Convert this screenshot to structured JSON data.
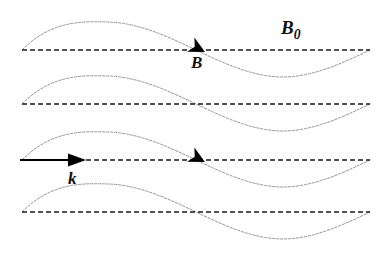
{
  "figure": {
    "type": "physics-wave-diagram",
    "canvas": {
      "width": 390,
      "height": 255,
      "background": "#ffffff"
    },
    "colors": {
      "axis_line": "#1a1a1a",
      "wave_curve": "#8a8a8a",
      "arrow": "#000000",
      "label_text": "#101010"
    },
    "axes": {
      "count": 4,
      "style": "dashed",
      "dash_length": 5,
      "dash_gap": 3,
      "thickness": 1.6,
      "x_start": 22,
      "x_end": 370,
      "y_positions": [
        50,
        104,
        160,
        212
      ]
    },
    "waves": {
      "count": 4,
      "style": "fine-dashed",
      "thickness": 0.9,
      "shape": "sine",
      "cycles": 1,
      "amplitude": 28,
      "x_start": 22,
      "x_end": 370,
      "crest_x": 109,
      "zero_crossing_x": 196,
      "trough_x": 283,
      "rows": [
        {
          "index": 1,
          "baseline_y": 50
        },
        {
          "index": 2,
          "baseline_y": 104
        },
        {
          "index": 3,
          "baseline_y": 160
        },
        {
          "index": 4,
          "baseline_y": 212
        }
      ]
    },
    "arrowheads": [
      {
        "name": "B-arrowhead-row1",
        "x": 200,
        "y": 50,
        "angle_deg": 27,
        "row": 1
      },
      {
        "name": "B-arrowhead-row3",
        "x": 200,
        "y": 160,
        "angle_deg": 27,
        "row": 3
      }
    ],
    "vector_k": {
      "label": "k",
      "x_start": 20,
      "x_end": 84,
      "y": 160,
      "thickness": 1.8,
      "style": "solid"
    },
    "labels": {
      "b0": {
        "text": "B",
        "subscript": "0",
        "x": 281,
        "y": 18
      },
      "b": {
        "text": "B",
        "x": 191,
        "y": 54
      },
      "k": {
        "text": "k",
        "x": 68,
        "y": 170
      }
    }
  }
}
